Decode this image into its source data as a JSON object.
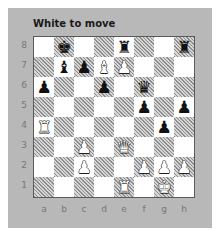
{
  "title": "White to move",
  "files": [
    "a",
    "b",
    "c",
    "d",
    "e",
    "f",
    "g",
    "h"
  ],
  "ranks": [
    "8",
    "7",
    "6",
    "5",
    "4",
    "3",
    "2",
    "1"
  ],
  "board_colors": {
    "light": "#ffffff",
    "dark_hatch": "#8e8e8e",
    "panel": "#b8b8b8"
  },
  "pieces": [
    {
      "square": "b8",
      "color": "black",
      "type": "king",
      "glyph": "♚"
    },
    {
      "square": "e8",
      "color": "black",
      "type": "rook",
      "glyph": "♜"
    },
    {
      "square": "h8",
      "color": "black",
      "type": "rook",
      "glyph": "♜"
    },
    {
      "square": "b7",
      "color": "black",
      "type": "bishop",
      "glyph": "♝"
    },
    {
      "square": "c7",
      "color": "black",
      "type": "pawn",
      "glyph": "♟"
    },
    {
      "square": "d7",
      "color": "white",
      "type": "bishop",
      "glyph": "♝"
    },
    {
      "square": "e7",
      "color": "white",
      "type": "pawn",
      "glyph": "♟"
    },
    {
      "square": "a6",
      "color": "black",
      "type": "pawn",
      "glyph": "♟"
    },
    {
      "square": "d6",
      "color": "black",
      "type": "pawn",
      "glyph": "♟"
    },
    {
      "square": "f6",
      "color": "black",
      "type": "queen",
      "glyph": "♛"
    },
    {
      "square": "f5",
      "color": "black",
      "type": "pawn",
      "glyph": "♟"
    },
    {
      "square": "h5",
      "color": "black",
      "type": "pawn",
      "glyph": "♟"
    },
    {
      "square": "a4",
      "color": "white",
      "type": "rook",
      "glyph": "♜"
    },
    {
      "square": "g4",
      "color": "black",
      "type": "pawn",
      "glyph": "♟"
    },
    {
      "square": "c3",
      "color": "white",
      "type": "pawn",
      "glyph": "♟"
    },
    {
      "square": "e3",
      "color": "white",
      "type": "queen",
      "glyph": "♛"
    },
    {
      "square": "c2",
      "color": "white",
      "type": "pawn",
      "glyph": "♟"
    },
    {
      "square": "f2",
      "color": "white",
      "type": "pawn",
      "glyph": "♟"
    },
    {
      "square": "g2",
      "color": "white",
      "type": "pawn",
      "glyph": "♟"
    },
    {
      "square": "h2",
      "color": "white",
      "type": "pawn",
      "glyph": "♟"
    },
    {
      "square": "e1",
      "color": "white",
      "type": "rook",
      "glyph": "♜"
    },
    {
      "square": "g1",
      "color": "white",
      "type": "king",
      "glyph": "♚"
    }
  ]
}
